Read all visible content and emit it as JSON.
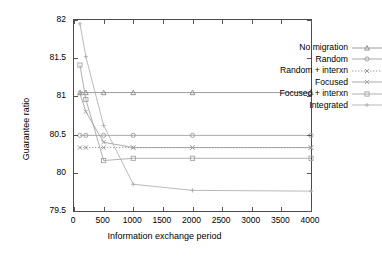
{
  "chart_data": {
    "type": "line",
    "title": "",
    "xlabel": "Information exchange period",
    "ylabel": "Guarantee ratio",
    "xlim": [
      0,
      4000
    ],
    "ylim": [
      79.5,
      82
    ],
    "xticks": [
      0,
      500,
      1000,
      1500,
      2000,
      2500,
      3000,
      3500,
      4000
    ],
    "xtick_labels": [
      "0",
      "500",
      "1000",
      "1500",
      "2000",
      "2500",
      "3000",
      "3500",
      "4000"
    ],
    "yticks": [
      79.5,
      80,
      80.5,
      81,
      81.5,
      82
    ],
    "ytick_labels": [
      "79.5",
      "80",
      "80.5",
      "81",
      "81.5",
      "82"
    ],
    "grid": false,
    "legend_position": "top-right",
    "x": [
      100,
      200,
      500,
      1000,
      2000,
      4000
    ],
    "series": [
      {
        "name": "No migration",
        "marker": "triangle",
        "linestyle": "solid",
        "color": "#8a8a8a",
        "values": [
          81.05,
          81.05,
          81.05,
          81.05,
          81.05,
          81.05
        ]
      },
      {
        "name": "Random",
        "marker": "circle",
        "linestyle": "solid",
        "color": "#9a9a9a",
        "values": [
          80.49,
          80.49,
          80.49,
          80.49,
          80.49,
          80.49
        ]
      },
      {
        "name": "Random + interxn",
        "marker": "cross",
        "linestyle": "dotted",
        "color": "#8f8f8f",
        "values": [
          80.33,
          80.33,
          80.33,
          80.33,
          80.33,
          80.33
        ]
      },
      {
        "name": "Focused",
        "marker": "cross",
        "linestyle": "solid",
        "color": "#9c9c9c",
        "values": [
          81.04,
          80.8,
          80.4,
          80.33,
          80.33,
          80.33
        ]
      },
      {
        "name": "Focused + interxn",
        "marker": "square",
        "linestyle": "solid",
        "color": "#a3a3a3",
        "values": [
          81.41,
          80.96,
          80.16,
          80.19,
          80.19,
          80.19
        ]
      },
      {
        "name": "Integrated",
        "marker": "plus",
        "linestyle": "solid",
        "color": "#adadad",
        "values": [
          81.95,
          81.52,
          80.62,
          79.85,
          79.77,
          79.76
        ]
      }
    ]
  }
}
